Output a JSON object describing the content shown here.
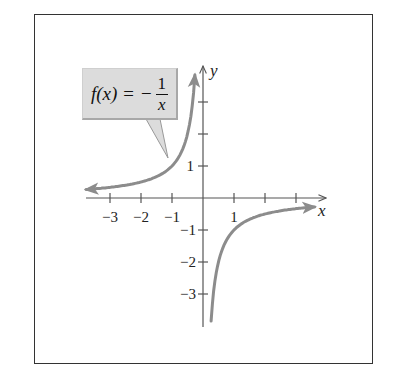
{
  "callout": {
    "lhs": "f(x) = −",
    "numerator": "1",
    "denominator": "x"
  },
  "axes": {
    "x_label": "x",
    "y_label": "y",
    "x_tick_labels": [
      "−3",
      "−2",
      "−1",
      "1"
    ],
    "y_tick_labels": [
      "1",
      "−1",
      "−2",
      "−3"
    ]
  },
  "colors": {
    "curve": "#8c8c8c",
    "axis": "#555555",
    "callout_fill": "#dcdcdc",
    "frame": "#333333"
  },
  "chart_data": {
    "type": "line",
    "xlabel": "x",
    "ylabel": "y",
    "xlim": [
      -3.8,
      4
    ],
    "ylim": [
      -4,
      4.2
    ],
    "x_ticks": [
      -3,
      -2,
      -1,
      1,
      2,
      3
    ],
    "y_ticks": [
      -3,
      -2,
      -1,
      1,
      2,
      3
    ],
    "x_tick_labels_shown": [
      "−3",
      "−2",
      "−1",
      "1"
    ],
    "y_tick_labels_shown": [
      "1",
      "−1",
      "−2",
      "−3"
    ],
    "grid": false,
    "legend": null,
    "annotations": [
      "f(x) = −1/x (callout box pointing to left branch)"
    ],
    "asymptotes": {
      "vertical": 0,
      "horizontal": 0
    },
    "series": [
      {
        "name": "left branch (x<0)",
        "x": [
          -3.77,
          -3,
          -2,
          -1.5,
          -1,
          -0.75,
          -0.5,
          -0.4,
          -0.3,
          -0.26
        ],
        "y": [
          0.27,
          0.33,
          0.5,
          0.67,
          1,
          1.33,
          2,
          2.5,
          3.33,
          3.85
        ]
      },
      {
        "name": "right branch (x>0)",
        "x": [
          0.26,
          0.3,
          0.4,
          0.5,
          0.75,
          1,
          1.5,
          2,
          3,
          3.6
        ],
        "y": [
          -3.85,
          -3.33,
          -2.5,
          -2,
          -1.33,
          -1,
          -0.67,
          -0.5,
          -0.33,
          -0.28
        ]
      }
    ]
  }
}
